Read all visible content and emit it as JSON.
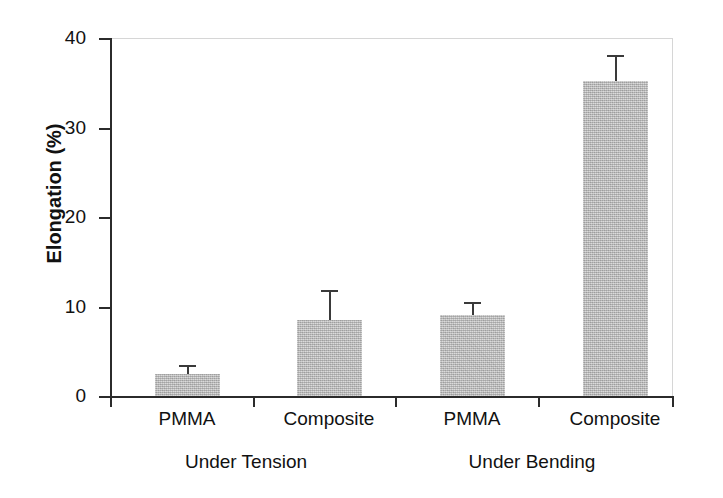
{
  "chart_data": {
    "type": "bar",
    "title": "",
    "xlabel": "",
    "ylabel": "Elongation (%)",
    "ylim": [
      0,
      40
    ],
    "yticks": [
      0,
      10,
      20,
      30,
      40
    ],
    "ytick_labels": [
      "0",
      "10",
      "20",
      "30",
      "40"
    ],
    "grid": false,
    "legend": "none",
    "categories": [
      "PMMA",
      "Composite",
      "PMMA",
      "Composite"
    ],
    "groups": [
      {
        "label": "Under Tension",
        "categories": [
          "PMMA",
          "Composite"
        ]
      },
      {
        "label": "Under Bending",
        "categories": [
          "PMMA",
          "Composite"
        ]
      }
    ],
    "values": [
      2.5,
      8.5,
      9.0,
      35.2
    ],
    "errors": [
      1.0,
      3.3,
      1.5,
      2.9
    ],
    "bars": [
      {
        "category": "PMMA",
        "group": "Under Tension",
        "value": 2.5,
        "error": 1.0
      },
      {
        "category": "Composite",
        "group": "Under Tension",
        "value": 8.5,
        "error": 3.3
      },
      {
        "category": "PMMA",
        "group": "Under Bending",
        "value": 9.0,
        "error": 1.5
      },
      {
        "category": "Composite",
        "group": "Under Bending",
        "value": 35.2,
        "error": 2.9
      }
    ],
    "bar_color": "#b2b2b2",
    "error_bar_color": "#3a3a3a",
    "axis_color": "#2b2b2b"
  },
  "axis": {
    "y_title": "Elongation (%)",
    "tick_labels": [
      "40",
      "30",
      "20",
      "10",
      "0"
    ]
  },
  "labels": {
    "cat_0": "PMMA",
    "cat_1": "Composite",
    "cat_2": "PMMA",
    "cat_3": "Composite",
    "group_0": "Under Tension",
    "group_1": "Under Bending"
  }
}
